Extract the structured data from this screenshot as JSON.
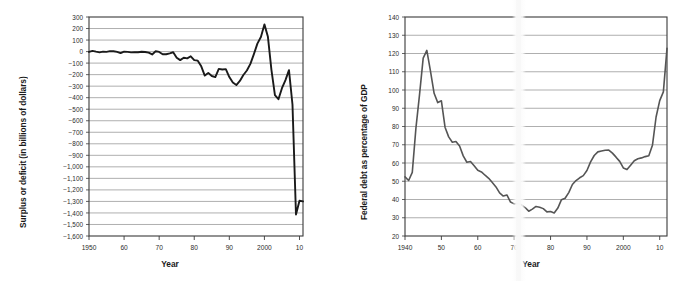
{
  "figure": {
    "panels": [
      "deficit-chart",
      "debt-chart"
    ]
  },
  "chart_data": [
    {
      "id": "deficit-chart",
      "type": "line",
      "title": "",
      "xlabel": "Year",
      "ylabel": "Surplus or deficit (in billions of dollars)",
      "xlim": [
        1950,
        2011
      ],
      "ylim": [
        -1600,
        300
      ],
      "grid": true,
      "legend": "none",
      "line_color": "#1a1a1a",
      "ytick_labels": [
        "300",
        "200",
        "100",
        "0",
        "−100",
        "−200",
        "−300",
        "−400",
        "−500",
        "−600",
        "−700",
        "−800",
        "−900",
        "−1,000",
        "−1,100",
        "−1,200",
        "−1,300",
        "−1,400",
        "−1,500",
        "−1,600"
      ],
      "ytick_values": [
        300,
        200,
        100,
        0,
        -100,
        -200,
        -300,
        -400,
        -500,
        -600,
        -700,
        -800,
        -900,
        -1000,
        -1100,
        -1200,
        -1300,
        -1400,
        -1500,
        -1600
      ],
      "xtick_labels": [
        "1950",
        "60",
        "70",
        "80",
        "90",
        "2000",
        "10"
      ],
      "xtick_values": [
        1950,
        1960,
        1970,
        1980,
        1990,
        2000,
        2010
      ],
      "x": [
        1950,
        1951,
        1952,
        1953,
        1954,
        1955,
        1956,
        1957,
        1958,
        1959,
        1960,
        1961,
        1962,
        1963,
        1964,
        1965,
        1966,
        1967,
        1968,
        1969,
        1970,
        1971,
        1972,
        1973,
        1974,
        1975,
        1976,
        1977,
        1978,
        1979,
        1980,
        1981,
        1982,
        1983,
        1984,
        1985,
        1986,
        1987,
        1988,
        1989,
        1990,
        1991,
        1992,
        1993,
        1994,
        1995,
        1996,
        1997,
        1998,
        1999,
        2000,
        2001,
        2002,
        2003,
        2004,
        2005,
        2006,
        2007,
        2008,
        2009,
        2010,
        2011
      ],
      "y": [
        -3,
        6,
        -1,
        -7,
        -1,
        -3,
        4,
        3,
        -3,
        -13,
        0,
        -3,
        -7,
        -5,
        -6,
        -1,
        -4,
        -9,
        -25,
        3,
        -3,
        -23,
        -23,
        -15,
        -6,
        -53,
        -74,
        -54,
        -59,
        -41,
        -74,
        -79,
        -128,
        -208,
        -185,
        -212,
        -221,
        -150,
        -155,
        -152,
        -221,
        -269,
        -290,
        -255,
        -203,
        -164,
        -107,
        -22,
        69,
        126,
        236,
        128,
        -158,
        -378,
        -413,
        -318,
        -248,
        -161,
        -459,
        -1413,
        -1294,
        -1300
      ],
      "annotations": []
    },
    {
      "id": "debt-chart",
      "type": "line",
      "title": "",
      "xlabel": "Year",
      "ylabel": "Federal debt as percentage of GDP",
      "xlim": [
        1940,
        2012
      ],
      "ylim": [
        20,
        140
      ],
      "grid": true,
      "legend": "none",
      "line_color": "#555555",
      "ytick_labels": [
        "140",
        "130",
        "120",
        "110",
        "100",
        "90",
        "80",
        "70",
        "60",
        "50",
        "40",
        "30",
        "20"
      ],
      "ytick_values": [
        140,
        130,
        120,
        110,
        100,
        90,
        80,
        70,
        60,
        50,
        40,
        30,
        20
      ],
      "xtick_labels": [
        "1940",
        "50",
        "60",
        "70",
        "80",
        "90",
        "2000",
        "10"
      ],
      "xtick_values": [
        1940,
        1950,
        1960,
        1970,
        1980,
        1990,
        2000,
        2010
      ],
      "x": [
        1940,
        1941,
        1942,
        1943,
        1944,
        1945,
        1946,
        1947,
        1948,
        1949,
        1950,
        1951,
        1952,
        1953,
        1954,
        1955,
        1956,
        1957,
        1958,
        1959,
        1960,
        1961,
        1962,
        1963,
        1964,
        1965,
        1966,
        1967,
        1968,
        1969,
        1970,
        1971,
        1972,
        1973,
        1974,
        1975,
        1976,
        1977,
        1978,
        1979,
        1980,
        1981,
        1982,
        1983,
        1984,
        1985,
        1986,
        1987,
        1988,
        1989,
        1990,
        1991,
        1992,
        1993,
        1994,
        1995,
        1996,
        1997,
        1998,
        1999,
        2000,
        2001,
        2002,
        2003,
        2004,
        2005,
        2006,
        2007,
        2008,
        2009,
        2010,
        2011,
        2012
      ],
      "y": [
        52.4,
        50.4,
        54.9,
        79.1,
        97.6,
        117.5,
        121.7,
        110.3,
        98.2,
        93.1,
        94.1,
        79.6,
        74.3,
        71.4,
        71.8,
        69.3,
        63.9,
        60.4,
        60.8,
        58.5,
        56.0,
        55.1,
        53.3,
        51.6,
        49.3,
        46.9,
        43.6,
        41.9,
        42.5,
        38.6,
        37.6,
        37.8,
        37.1,
        35.6,
        33.6,
        34.7,
        36.2,
        35.8,
        35.0,
        33.2,
        33.4,
        32.6,
        35.3,
        39.9,
        40.7,
        43.8,
        48.2,
        50.4,
        51.9,
        53.1,
        55.9,
        60.6,
        64.1,
        66.1,
        66.6,
        67.0,
        67.1,
        65.4,
        63.2,
        60.9,
        57.3,
        56.4,
        58.8,
        61.2,
        62.3,
        62.8,
        63.5,
        64.0,
        69.7,
        85.2,
        94.2,
        99.0,
        122.8
      ],
      "annotations": []
    }
  ]
}
